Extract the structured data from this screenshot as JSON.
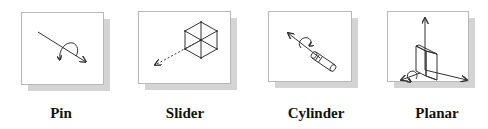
{
  "figure": {
    "items": [
      {
        "id": "pin",
        "label": "Pin",
        "icon": "pin-joint-icon"
      },
      {
        "id": "slider",
        "label": "Slider",
        "icon": "slider-joint-icon"
      },
      {
        "id": "cylinder",
        "label": "Cylinder",
        "icon": "cylinder-joint-icon"
      },
      {
        "id": "planar",
        "label": "Planar",
        "icon": "planar-joint-icon"
      }
    ]
  },
  "colors": {
    "tile_border": "#b8b8b8",
    "tile_shadow": "#d4d4d4",
    "stroke": "#333333",
    "label": "#111111"
  }
}
